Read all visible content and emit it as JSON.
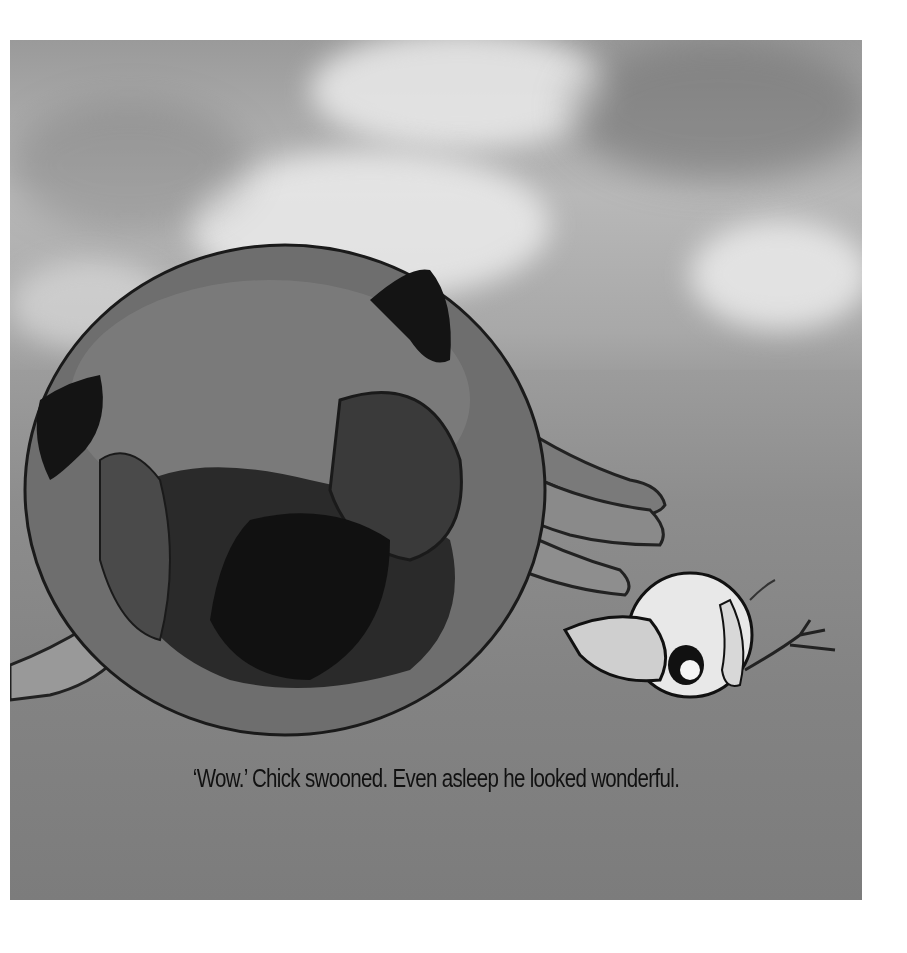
{
  "page": {
    "caption": "‘Wow.’ Chick swooned. Even asleep he looked wonderful.",
    "illustration": {
      "subject": "large sleeping pig lying on its side with a small round chick bowing nearby",
      "palette": {
        "sky_light": "#e6e6e6",
        "sky_mid": "#a8a8a8",
        "ground": "#858585",
        "pig_body": "#6a6a6a",
        "pig_shadow": "#1e1e1e",
        "chick_body": "#e8e8e8",
        "ink": "#111111"
      }
    }
  }
}
